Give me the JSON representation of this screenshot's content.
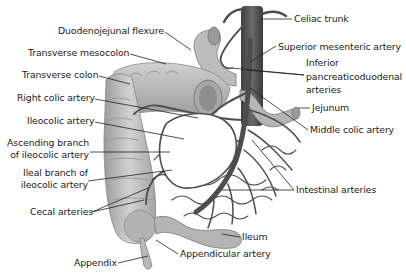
{
  "diagram": {
    "type": "anatomical illustration",
    "labels_left": [
      {
        "id": "duodenojejunal-flexure",
        "text": "Duodenojejunal flexure"
      },
      {
        "id": "transverse-mesocolon",
        "text": "Transverse mesocolon"
      },
      {
        "id": "transverse-colon",
        "text": "Transverse colon"
      },
      {
        "id": "right-colic-artery",
        "text": "Right colic artery"
      },
      {
        "id": "ileocolic-artery",
        "text": "Ileocolic artery"
      },
      {
        "id": "ascending-branch",
        "text_line1": "Ascending branch",
        "text_line2": "of ileocolic artery"
      },
      {
        "id": "ileal-branch",
        "text_line1": "Ileal branch of",
        "text_line2": "ileocolic artery"
      },
      {
        "id": "cecal-arteries",
        "text": "Cecal arteries"
      },
      {
        "id": "appendix",
        "text": "Appendix"
      }
    ],
    "labels_right": [
      {
        "id": "celiac-trunk",
        "text": "Celiac trunk"
      },
      {
        "id": "superior-mesenteric-artery",
        "text": "Superior mesenteric artery"
      },
      {
        "id": "inferior-pancreaticoduodenal-arteries",
        "text_line1": "Inferior",
        "text_line2": "pancreaticoduodenal",
        "text_line3": "arteries"
      },
      {
        "id": "jejunum",
        "text": "Jejunum"
      },
      {
        "id": "middle-colic-artery",
        "text": "Middle colic artery"
      },
      {
        "id": "intestinal-arteries",
        "text": "Intestinal arteries"
      },
      {
        "id": "ileum",
        "text": "Ileum"
      },
      {
        "id": "appendicular-artery",
        "text": "Appendicular artery"
      }
    ],
    "colors": {
      "background": "#ffffff",
      "tissue": "#b9b9b9",
      "tissue_dark": "#8a8a8a",
      "artery": "#555555",
      "leader_line": "#222222",
      "text": "#1a1a1a"
    }
  }
}
